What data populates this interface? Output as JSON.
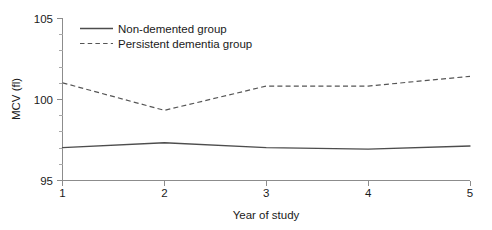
{
  "chart_data": {
    "type": "line",
    "title": "",
    "xlabel": "Year of study",
    "ylabel": "MCV (fl)",
    "x": [
      1,
      2,
      3,
      4,
      5
    ],
    "xticklabels": [
      "1",
      "2",
      "3",
      "4",
      "5"
    ],
    "xlim": [
      1,
      5
    ],
    "ylim": [
      95,
      105
    ],
    "yticklabels": [
      "95",
      "100",
      "105"
    ],
    "yticks": [
      95,
      100,
      105
    ],
    "yminor_ticks": [
      96,
      97,
      98,
      99,
      101,
      102,
      103,
      104
    ],
    "grid": false,
    "legend_position": "top-left-inside",
    "series": [
      {
        "name": "Non-demented group",
        "style": "solid",
        "color": "#4d4d4d",
        "values": [
          97.0,
          97.3,
          97.0,
          96.9,
          97.1
        ]
      },
      {
        "name": "Persistent dementia group",
        "style": "dashed",
        "color": "#555555",
        "values": [
          101.0,
          99.3,
          100.8,
          100.8,
          101.4
        ]
      }
    ]
  },
  "legend": {
    "items": [
      {
        "label": "Non-demented group"
      },
      {
        "label": "Persistent dementia group"
      }
    ]
  },
  "axes": {
    "y_title": "MCV (fl)",
    "x_title": "Year of study",
    "y_tick_0": "95",
    "y_tick_1": "100",
    "y_tick_2": "105",
    "x_tick_0": "1",
    "x_tick_1": "2",
    "x_tick_2": "3",
    "x_tick_3": "4",
    "x_tick_4": "5"
  },
  "colors": {
    "axis": "#8c8c8c",
    "solid_series": "#4d4d4d",
    "dashed_series": "#555555",
    "text": "#1a1a1a",
    "background": "#ffffff"
  }
}
